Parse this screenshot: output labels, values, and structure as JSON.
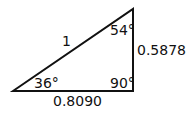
{
  "diagram": {
    "type": "right-triangle",
    "stroke_color": "#111111",
    "vertices": {
      "left": [
        13,
        91
      ],
      "top_right": [
        133,
        9
      ],
      "bottom_right": [
        133,
        91
      ]
    },
    "sides": {
      "hypotenuse": "1",
      "opposite_vertical": "0.5878",
      "adjacent_horizontal": "0.8090"
    },
    "angles": {
      "left": "36°",
      "top": "54°",
      "right": "90°"
    }
  }
}
